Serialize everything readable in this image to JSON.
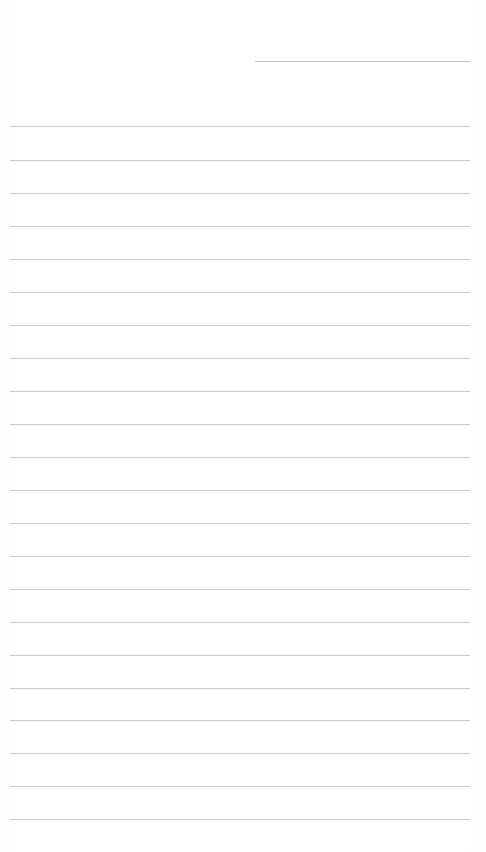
{
  "document": {
    "kind": "lined-paper",
    "title": "Lined Paper",
    "background_color": "#ffffff",
    "width_px": 486,
    "height_px": 852,
    "content_text": ""
  },
  "ruling": {
    "line_color": "#c9c9ce",
    "header_line_color": "#b9b9bf",
    "line_thickness_px": 1,
    "line_spacing_px": 33.3,
    "body_left_px": 10,
    "body_right_px": 470,
    "header_left_px": 255,
    "header_right_px": 470,
    "body_line_count": 22,
    "header_line_count": 1,
    "total_line_count": 23
  },
  "lines": [
    {
      "name": "header-rule",
      "role": "date-line",
      "y": 61,
      "x1": 255,
      "x2": 470,
      "text": ""
    },
    {
      "name": "body-rule-1",
      "role": "writing-line",
      "y": 126,
      "x1": 10,
      "x2": 470,
      "text": ""
    },
    {
      "name": "body-rule-2",
      "role": "writing-line",
      "y": 160,
      "x1": 10,
      "x2": 470,
      "text": ""
    },
    {
      "name": "body-rule-3",
      "role": "writing-line",
      "y": 193,
      "x1": 10,
      "x2": 470,
      "text": ""
    },
    {
      "name": "body-rule-4",
      "role": "writing-line",
      "y": 226,
      "x1": 10,
      "x2": 470,
      "text": ""
    },
    {
      "name": "body-rule-5",
      "role": "writing-line",
      "y": 259,
      "x1": 10,
      "x2": 470,
      "text": ""
    },
    {
      "name": "body-rule-6",
      "role": "writing-line",
      "y": 292,
      "x1": 10,
      "x2": 470,
      "text": ""
    },
    {
      "name": "body-rule-7",
      "role": "writing-line",
      "y": 325,
      "x1": 10,
      "x2": 470,
      "text": ""
    },
    {
      "name": "body-rule-8",
      "role": "writing-line",
      "y": 358,
      "x1": 10,
      "x2": 470,
      "text": ""
    },
    {
      "name": "body-rule-9",
      "role": "writing-line",
      "y": 391,
      "x1": 10,
      "x2": 470,
      "text": ""
    },
    {
      "name": "body-rule-10",
      "role": "writing-line",
      "y": 424,
      "x1": 10,
      "x2": 470,
      "text": ""
    },
    {
      "name": "body-rule-11",
      "role": "writing-line",
      "y": 457,
      "x1": 10,
      "x2": 470,
      "text": ""
    },
    {
      "name": "body-rule-12",
      "role": "writing-line",
      "y": 490,
      "x1": 10,
      "x2": 470,
      "text": ""
    },
    {
      "name": "body-rule-13",
      "role": "writing-line",
      "y": 523,
      "x1": 10,
      "x2": 470,
      "text": ""
    },
    {
      "name": "body-rule-14",
      "role": "writing-line",
      "y": 556,
      "x1": 10,
      "x2": 470,
      "text": ""
    },
    {
      "name": "body-rule-15",
      "role": "writing-line",
      "y": 589,
      "x1": 10,
      "x2": 470,
      "text": ""
    },
    {
      "name": "body-rule-16",
      "role": "writing-line",
      "y": 622,
      "x1": 10,
      "x2": 470,
      "text": ""
    },
    {
      "name": "body-rule-17",
      "role": "writing-line",
      "y": 655,
      "x1": 10,
      "x2": 470,
      "text": ""
    },
    {
      "name": "body-rule-18",
      "role": "writing-line",
      "y": 688,
      "x1": 10,
      "x2": 470,
      "text": ""
    },
    {
      "name": "body-rule-19",
      "role": "writing-line",
      "y": 720,
      "x1": 10,
      "x2": 470,
      "text": ""
    },
    {
      "name": "body-rule-20",
      "role": "writing-line",
      "y": 753,
      "x1": 10,
      "x2": 470,
      "text": ""
    },
    {
      "name": "body-rule-21",
      "role": "writing-line",
      "y": 786,
      "x1": 10,
      "x2": 470,
      "text": ""
    },
    {
      "name": "body-rule-22",
      "role": "writing-line",
      "y": 819,
      "x1": 10,
      "x2": 470,
      "text": ""
    }
  ]
}
